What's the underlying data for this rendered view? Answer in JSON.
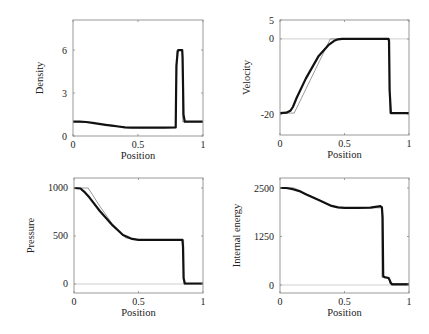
{
  "chart_data": [
    {
      "type": "line",
      "title": "",
      "xlabel": "Position",
      "ylabel": "Density",
      "xlim": [
        0,
        1
      ],
      "ylim": [
        0,
        8.1
      ],
      "xticks": [
        0,
        0.5,
        1
      ],
      "xtick_labels": [
        "0",
        "0.5",
        "1"
      ],
      "yticks": [
        0,
        3,
        6
      ],
      "ytick_labels": [
        "0",
        "3",
        "6"
      ],
      "zero_line": false,
      "box": {
        "left": 73,
        "top": 20,
        "right": 203,
        "bottom": 136
      },
      "series": [
        {
          "name": "exact",
          "x": [
            0,
            0.1,
            0.2,
            0.3,
            0.42,
            0.5,
            0.79,
            0.8,
            0.84,
            0.845,
            1
          ],
          "y": [
            1,
            1,
            0.85,
            0.7,
            0.58,
            0.58,
            0.58,
            5.99,
            5.99,
            1,
            1
          ]
        },
        {
          "name": "numerical",
          "x": [
            0,
            0.05,
            0.1,
            0.15,
            0.2,
            0.25,
            0.3,
            0.35,
            0.4,
            0.45,
            0.5,
            0.6,
            0.7,
            0.79,
            0.795,
            0.805,
            0.81,
            0.84,
            0.843,
            0.85,
            0.86,
            0.9,
            1
          ],
          "y": [
            1,
            1,
            0.98,
            0.92,
            0.85,
            0.78,
            0.72,
            0.66,
            0.61,
            0.58,
            0.58,
            0.58,
            0.58,
            0.6,
            4.9,
            5.9,
            6.0,
            6.0,
            5.5,
            1.5,
            1.0,
            1.0,
            1.0
          ]
        }
      ]
    },
    {
      "type": "line",
      "title": "",
      "xlabel": "Position",
      "ylabel": "Velocity",
      "xlim": [
        0,
        1
      ],
      "ylim": [
        -25.4,
        5
      ],
      "xticks": [
        0,
        0.5,
        1
      ],
      "xtick_labels": [
        "0",
        "0.5",
        "1"
      ],
      "yticks": [
        -20,
        0,
        5
      ],
      "ytick_labels": [
        "-20",
        "0",
        "5"
      ],
      "zero_line": true,
      "box": {
        "left": 280,
        "top": 20,
        "right": 409,
        "bottom": 135
      },
      "series": [
        {
          "name": "exact",
          "x": [
            0,
            0.11,
            0.39,
            0.4,
            0.85,
            0.851,
            1
          ],
          "y": [
            -19.6,
            -19.6,
            0,
            0,
            0,
            -19.6,
            -19.6
          ]
        },
        {
          "name": "numerical",
          "x": [
            0,
            0.05,
            0.08,
            0.1,
            0.13,
            0.2,
            0.3,
            0.38,
            0.42,
            0.45,
            0.48,
            0.5,
            0.6,
            0.7,
            0.84,
            0.845,
            0.85,
            0.86,
            1
          ],
          "y": [
            -19.6,
            -19.5,
            -19.0,
            -18.0,
            -15.5,
            -10.5,
            -4.5,
            -1.5,
            -0.5,
            -0.1,
            0,
            0,
            0,
            0,
            0,
            -0.5,
            -13.5,
            -19.6,
            -19.6
          ]
        }
      ]
    },
    {
      "type": "line",
      "title": "",
      "xlabel": "Position",
      "ylabel": "Pressure",
      "xlim": [
        0,
        1
      ],
      "ylim": [
        -94,
        1104
      ],
      "xticks": [
        0,
        0.5,
        1
      ],
      "xtick_labels": [
        "0",
        "0.5",
        "1"
      ],
      "yticks": [
        0,
        500,
        1000
      ],
      "ytick_labels": [
        "0",
        "500",
        "1000"
      ],
      "zero_line": true,
      "box": {
        "left": 74,
        "top": 178,
        "right": 203,
        "bottom": 293
      },
      "series": [
        {
          "name": "exact",
          "x": [
            0,
            0.11,
            0.2,
            0.3,
            0.4,
            0.5,
            0.85,
            0.851,
            1
          ],
          "y": [
            1000,
            1000,
            810,
            620,
            480,
            460,
            460,
            0.01,
            0.01
          ]
        },
        {
          "name": "numerical",
          "x": [
            0,
            0.05,
            0.08,
            0.12,
            0.2,
            0.3,
            0.38,
            0.45,
            0.5,
            0.6,
            0.7,
            0.84,
            0.845,
            0.85,
            0.86,
            1
          ],
          "y": [
            1000,
            995,
            960,
            900,
            760,
            610,
            510,
            470,
            460,
            460,
            460,
            460,
            390,
            60,
            5,
            5
          ]
        }
      ]
    },
    {
      "type": "line",
      "title": "",
      "xlabel": "Position",
      "ylabel": "Internal energy",
      "xlim": [
        0,
        1
      ],
      "ylim": [
        -206,
        2758
      ],
      "xticks": [
        0,
        0.5,
        1
      ],
      "xtick_labels": [
        "0",
        "0.5",
        "1"
      ],
      "yticks": [
        0,
        1250,
        2500
      ],
      "ytick_labels": [
        "0",
        "1250",
        "2500"
      ],
      "zero_line": true,
      "box": {
        "left": 280,
        "top": 178,
        "right": 409,
        "bottom": 293
      },
      "series": [
        {
          "name": "exact",
          "x": [
            0,
            0.11,
            0.2,
            0.3,
            0.4,
            0.45,
            0.79,
            0.791,
            0.85,
            0.851,
            1
          ],
          "y": [
            2500,
            2500,
            2350,
            2200,
            2030,
            1990,
            1990,
            195,
            195,
            38,
            38
          ]
        },
        {
          "name": "numerical",
          "x": [
            0,
            0.05,
            0.1,
            0.15,
            0.2,
            0.3,
            0.4,
            0.45,
            0.5,
            0.6,
            0.7,
            0.78,
            0.79,
            0.795,
            0.8,
            0.81,
            0.84,
            0.85,
            0.86,
            0.87,
            1
          ],
          "y": [
            2500,
            2500,
            2470,
            2420,
            2340,
            2190,
            2040,
            2000,
            1990,
            1990,
            1995,
            2030,
            2000,
            1750,
            230,
            200,
            180,
            130,
            50,
            15,
            15
          ]
        }
      ]
    }
  ]
}
